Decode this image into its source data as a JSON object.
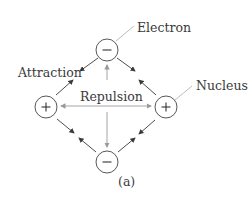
{
  "diagram": {
    "labels": {
      "electron": "Electron",
      "nucleus": "Nucleus",
      "attraction": "Attraction",
      "repulsion": "Repulsion",
      "caption": "(a)"
    },
    "particles": [
      {
        "id": "electron-top",
        "type": "electron",
        "sign": "−",
        "cx": 107,
        "cy": 50
      },
      {
        "id": "nucleus-left",
        "type": "nucleus",
        "sign": "+",
        "cx": 46,
        "cy": 107
      },
      {
        "id": "nucleus-right",
        "type": "nucleus",
        "sign": "+",
        "cx": 166,
        "cy": 107
      },
      {
        "id": "electron-bottom",
        "type": "electron",
        "sign": "−",
        "cx": 107,
        "cy": 162
      }
    ],
    "colors": {
      "attraction_arrow": "#3a3a3a",
      "repulsion_arrow": "#9a9a9a",
      "leader_line": "#b5b5b5",
      "circle_stroke": "#444444"
    }
  }
}
